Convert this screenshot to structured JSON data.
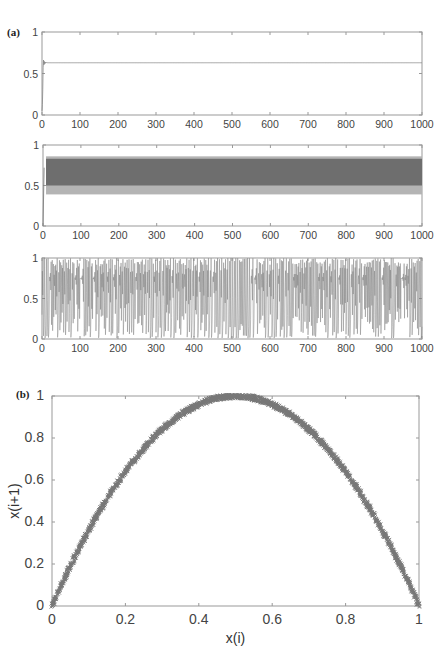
{
  "figure": {
    "panel_a_label": "(a)",
    "panel_b_label": "(b)"
  },
  "chart_data": [
    {
      "type": "line",
      "panel": "(a) top",
      "title": "",
      "xlabel": "",
      "ylabel": "",
      "xlim": [
        0,
        1000
      ],
      "ylim": [
        0,
        1
      ],
      "xticks": [
        0,
        100,
        200,
        300,
        400,
        500,
        600,
        700,
        800,
        900,
        1000
      ],
      "yticks": [
        0,
        0.5,
        1
      ],
      "ytick_labels": [
        "0",
        "0.5",
        "1"
      ],
      "description": "Converges quickly to a fixed point",
      "fixed_point": 0.63,
      "color": "#888888",
      "grid": false
    },
    {
      "type": "line",
      "panel": "(a) middle",
      "title": "",
      "xlabel": "",
      "ylabel": "",
      "xlim": [
        0,
        1000
      ],
      "ylim": [
        0,
        1
      ],
      "xticks": [
        0,
        100,
        200,
        300,
        400,
        500,
        600,
        700,
        800,
        900,
        1000
      ],
      "yticks": [
        0,
        0.5,
        1
      ],
      "ytick_labels": [
        "0",
        "0.5",
        "1"
      ],
      "description": "Periodic oscillation band",
      "band_dark": [
        0.5,
        0.83
      ],
      "band_light": [
        0.39,
        0.86
      ],
      "color_dark": "#6e6e6e",
      "color_light": "#b4b4b4",
      "grid": false
    },
    {
      "type": "line",
      "panel": "(a) bottom",
      "title": "",
      "xlabel": "",
      "ylabel": "",
      "xlim": [
        0,
        1000
      ],
      "ylim": [
        0,
        1
      ],
      "xticks": [
        0,
        100,
        200,
        300,
        400,
        500,
        600,
        700,
        800,
        900,
        1000
      ],
      "yticks": [
        0,
        0.5,
        1
      ],
      "ytick_labels": [
        "0",
        "0.5",
        "1"
      ],
      "description": "Chaotic time series (logistic map, r≈4), values spanning 0 to 1",
      "color": "#7a7a7a",
      "grid": false
    },
    {
      "type": "scatter",
      "panel": "(b)",
      "title": "",
      "xlabel": "x(i)",
      "ylabel": "x(i+1)",
      "xlim": [
        0,
        1
      ],
      "ylim": [
        0,
        1
      ],
      "xticks": [
        0,
        0.2,
        0.4,
        0.6,
        0.8,
        1
      ],
      "xtick_labels": [
        "0",
        "0.2",
        "0.4",
        "0.6",
        "0.8",
        "1"
      ],
      "yticks": [
        0,
        0.2,
        0.4,
        0.6,
        0.8,
        1
      ],
      "ytick_labels": [
        "0",
        "0.2",
        "0.4",
        "0.6",
        "0.8",
        "1"
      ],
      "description": "Return map forming parabola x(i+1)=4x(i)(1-x(i))",
      "x": [
        0,
        0.1,
        0.2,
        0.3,
        0.4,
        0.5,
        0.6,
        0.7,
        0.8,
        0.9,
        1
      ],
      "y": [
        0,
        0.36,
        0.64,
        0.84,
        0.96,
        1.0,
        0.96,
        0.84,
        0.64,
        0.36,
        0
      ],
      "marker": "x",
      "color": "#777777",
      "grid": false
    }
  ]
}
